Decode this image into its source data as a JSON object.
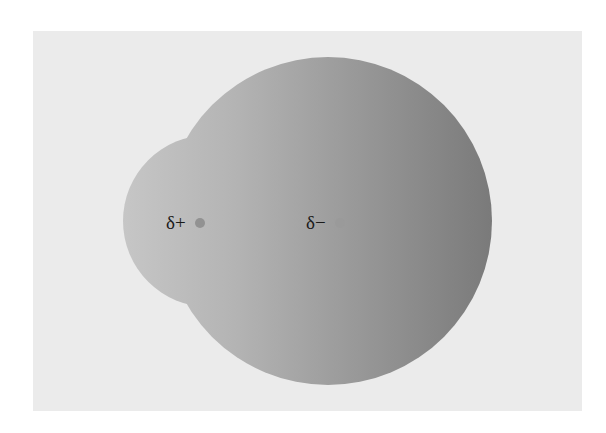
{
  "diagram": {
    "title": "",
    "colors": {
      "background": "#ebebeb",
      "gradient_start": "#c4c4c4",
      "gradient_end": "#7c7c7c",
      "dot": "#8f8f8f"
    },
    "small_lobe": {
      "cx": 209,
      "cy": 221,
      "r": 86
    },
    "large_lobe": {
      "cx": 328,
      "cy": 221,
      "r": 164
    },
    "charges": [
      {
        "label": "δ+",
        "dot_x": 200,
        "dot_y": 223
      },
      {
        "label": "δ−",
        "dot_x": 340,
        "dot_y": 223
      }
    ]
  }
}
